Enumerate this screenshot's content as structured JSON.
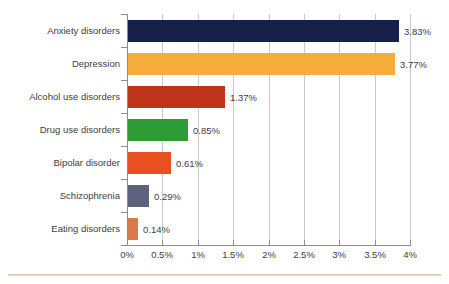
{
  "chart_data": {
    "type": "bar",
    "orientation": "horizontal",
    "title": "",
    "subtitle": "",
    "xlabel": "",
    "ylabel": "",
    "categories": [
      "Anxiety disorders",
      "Depression",
      "Alcohol use disorders",
      "Drug use disorders",
      "Bipolar disorder",
      "Schizophrenia",
      "Eating disorders"
    ],
    "values": [
      3.83,
      3.77,
      1.37,
      0.85,
      0.61,
      0.29,
      0.14
    ],
    "value_labels": [
      "3.83%",
      "3.77%",
      "1.37%",
      "0.85%",
      "0.61%",
      "0.29%",
      "0.14%"
    ],
    "bar_colors": [
      "#16214b",
      "#f6ad3c",
      "#c0341a",
      "#2e9c34",
      "#e8511f",
      "#5d637c",
      "#d9794a"
    ],
    "xlim": [
      0,
      4
    ],
    "x_tick_values": [
      0,
      0.5,
      1,
      1.5,
      2,
      2.5,
      3,
      3.5,
      4
    ],
    "x_tick_labels": [
      "0%",
      "0.5%",
      "1%",
      "1.5%",
      "2%",
      "2.5%",
      "3%",
      "3.5%",
      "4%"
    ],
    "grid": "vertical",
    "legend": "none",
    "gridline_color": "#c9c9c9",
    "axis_color": "#8d8d8d",
    "text_color": "#3d3d3d",
    "background_color": "#ffffff",
    "accent_rule_color": "#eccfb6"
  }
}
